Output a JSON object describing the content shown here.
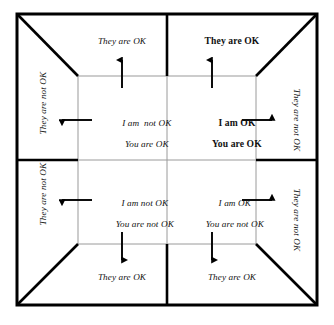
{
  "diagram": {
    "name": "ok-corral-life-positions",
    "background_color": "#ffffff",
    "frame_color": "#000000",
    "inner_line_color": "#8c8c8c",
    "text_color": "#111111",
    "quadrants": [
      {
        "id": "upper-left",
        "line1": "I am  not OK",
        "line2": "You are OK",
        "emphasis": "italic",
        "arrow": "left"
      },
      {
        "id": "upper-right",
        "line1": "I am OK",
        "line2": "You are OK",
        "emphasis": "bold",
        "arrow": "right"
      },
      {
        "id": "lower-left",
        "line1": "I am not OK",
        "line2": "You are not OK",
        "emphasis": "italic",
        "arrow": "left"
      },
      {
        "id": "lower-right",
        "line1": "I am OK",
        "line2": "You are not OK",
        "emphasis": "italic",
        "arrow": "right"
      }
    ],
    "outer_labels": [
      {
        "id": "top-left",
        "text": "They are OK",
        "emphasis": "italic",
        "orientation": "horizontal"
      },
      {
        "id": "top-right",
        "text": "They are OK",
        "emphasis": "bold",
        "orientation": "horizontal"
      },
      {
        "id": "bottom-left",
        "text": "They are OK",
        "emphasis": "italic",
        "orientation": "horizontal"
      },
      {
        "id": "bottom-right",
        "text": "They are OK",
        "emphasis": "italic",
        "orientation": "horizontal"
      },
      {
        "id": "left-upper",
        "text": "They are not OK",
        "emphasis": "italic",
        "orientation": "vertical-up"
      },
      {
        "id": "left-lower",
        "text": "They are not OK",
        "emphasis": "italic",
        "orientation": "vertical-up"
      },
      {
        "id": "right-upper",
        "text": "They are not OK",
        "emphasis": "italic",
        "orientation": "vertical-down"
      },
      {
        "id": "right-lower",
        "text": "They are not OK",
        "emphasis": "italic",
        "orientation": "vertical-down"
      }
    ],
    "arrows": [
      {
        "id": "arrow-up-left",
        "direction": "up"
      },
      {
        "id": "arrow-up-right",
        "direction": "up"
      },
      {
        "id": "arrow-down-left",
        "direction": "down"
      },
      {
        "id": "arrow-down-right",
        "direction": "down"
      },
      {
        "id": "arrow-left-upper",
        "direction": "left"
      },
      {
        "id": "arrow-left-lower",
        "direction": "left"
      },
      {
        "id": "arrow-right-upper",
        "direction": "right"
      },
      {
        "id": "arrow-right-lower",
        "direction": "right"
      }
    ]
  }
}
